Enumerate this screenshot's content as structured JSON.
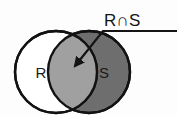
{
  "figure": {
    "kind": "venn-diagram",
    "title_label": "R∩S",
    "sets": [
      {
        "id": "R",
        "label": "R",
        "fill": "#ffffff",
        "stroke": "#121212",
        "cx": 56,
        "cy": 72,
        "r": 41
      },
      {
        "id": "S",
        "label": "S",
        "fill": "#6e6e6e",
        "stroke": "#121212",
        "cx": 89,
        "cy": 72,
        "r": 41
      }
    ],
    "intersection": {
      "label": "R∩S",
      "fill": "#a0a0a0",
      "stroke": "#121212"
    },
    "leader": {
      "horizontal_label": "R∩S",
      "stroke": "#141414",
      "arrow_tip_x": 75,
      "arrow_tip_y": 66,
      "elbow_x": 103,
      "elbow_y": 31,
      "line_end_x": 177,
      "line_end_y": 31
    },
    "background": "#fdfdfd"
  }
}
